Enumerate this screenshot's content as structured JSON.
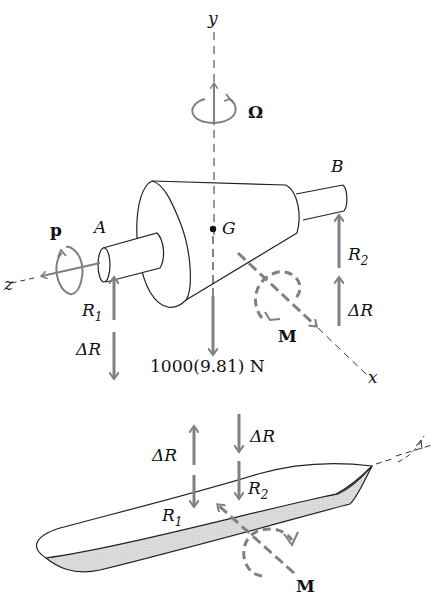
{
  "figure": {
    "top": {
      "axes": {
        "y": "y",
        "z": "z",
        "x": "x"
      },
      "spin_label": "Ω",
      "precession_label": "p",
      "points": {
        "A": "A",
        "B": "B",
        "G": "G"
      },
      "reactions": {
        "R1": {
          "base": "R",
          "sub": "1"
        },
        "R2": {
          "base": "R",
          "sub": "2"
        },
        "dR_left": "ΔR",
        "dR_right": "ΔR"
      },
      "weight_label": "1000(9.81) N",
      "moment_label": "M"
    },
    "bottom": {
      "dR_up": "ΔR",
      "dR_down": "ΔR",
      "R1": {
        "base": "R",
        "sub": "1"
      },
      "R2": {
        "base": "R",
        "sub": "2"
      },
      "moment_label": "M"
    },
    "colors": {
      "line": "#222222",
      "vector": "#808080",
      "hull_shade": "#d9d9d9"
    }
  }
}
